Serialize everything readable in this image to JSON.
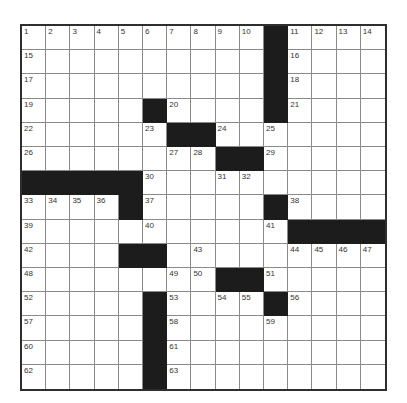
{
  "puzzle": {
    "size": 15,
    "colors": {
      "block": "#1c1c1c",
      "border": "#2e2e2e",
      "gridline": "#8a8a8a"
    },
    "rows": [
      "..........#....",
      "..........#....",
      "..........#....",
      ".....#....#....",
      "......##.......",
      "........##.....",
      "#####..........",
      "....#.....#....",
      "...........####",
      "....##.........",
      "........##.....",
      ".....#....#....",
      ".....#.........",
      ".....#.........",
      ".....#........."
    ],
    "numbers": [
      {
        "r": 0,
        "c": 0,
        "n": "1"
      },
      {
        "r": 0,
        "c": 1,
        "n": "2"
      },
      {
        "r": 0,
        "c": 2,
        "n": "3"
      },
      {
        "r": 0,
        "c": 3,
        "n": "4"
      },
      {
        "r": 0,
        "c": 4,
        "n": "5"
      },
      {
        "r": 0,
        "c": 5,
        "n": "6"
      },
      {
        "r": 0,
        "c": 6,
        "n": "7"
      },
      {
        "r": 0,
        "c": 7,
        "n": "8"
      },
      {
        "r": 0,
        "c": 8,
        "n": "9"
      },
      {
        "r": 0,
        "c": 9,
        "n": "10"
      },
      {
        "r": 0,
        "c": 11,
        "n": "11"
      },
      {
        "r": 0,
        "c": 12,
        "n": "12"
      },
      {
        "r": 0,
        "c": 13,
        "n": "13"
      },
      {
        "r": 0,
        "c": 14,
        "n": "14"
      },
      {
        "r": 1,
        "c": 0,
        "n": "15"
      },
      {
        "r": 1,
        "c": 11,
        "n": "16"
      },
      {
        "r": 2,
        "c": 0,
        "n": "17"
      },
      {
        "r": 2,
        "c": 11,
        "n": "18"
      },
      {
        "r": 3,
        "c": 0,
        "n": "19"
      },
      {
        "r": 3,
        "c": 6,
        "n": "20"
      },
      {
        "r": 3,
        "c": 11,
        "n": "21"
      },
      {
        "r": 4,
        "c": 0,
        "n": "22"
      },
      {
        "r": 4,
        "c": 5,
        "n": "23"
      },
      {
        "r": 4,
        "c": 8,
        "n": "24"
      },
      {
        "r": 4,
        "c": 10,
        "n": "25"
      },
      {
        "r": 5,
        "c": 0,
        "n": "26"
      },
      {
        "r": 5,
        "c": 6,
        "n": "27"
      },
      {
        "r": 5,
        "c": 7,
        "n": "28"
      },
      {
        "r": 5,
        "c": 10,
        "n": "29"
      },
      {
        "r": 6,
        "c": 5,
        "n": "30"
      },
      {
        "r": 6,
        "c": 8,
        "n": "31"
      },
      {
        "r": 6,
        "c": 9,
        "n": "32"
      },
      {
        "r": 7,
        "c": 0,
        "n": "33"
      },
      {
        "r": 7,
        "c": 1,
        "n": "34"
      },
      {
        "r": 7,
        "c": 2,
        "n": "35"
      },
      {
        "r": 7,
        "c": 3,
        "n": "36"
      },
      {
        "r": 7,
        "c": 5,
        "n": "37"
      },
      {
        "r": 7,
        "c": 11,
        "n": "38"
      },
      {
        "r": 8,
        "c": 0,
        "n": "39"
      },
      {
        "r": 8,
        "c": 5,
        "n": "40"
      },
      {
        "r": 8,
        "c": 10,
        "n": "41"
      },
      {
        "r": 9,
        "c": 0,
        "n": "42"
      },
      {
        "r": 9,
        "c": 7,
        "n": "43"
      },
      {
        "r": 9,
        "c": 11,
        "n": "44"
      },
      {
        "r": 9,
        "c": 12,
        "n": "45"
      },
      {
        "r": 9,
        "c": 13,
        "n": "46"
      },
      {
        "r": 9,
        "c": 14,
        "n": "47"
      },
      {
        "r": 10,
        "c": 0,
        "n": "48"
      },
      {
        "r": 10,
        "c": 6,
        "n": "49"
      },
      {
        "r": 10,
        "c": 7,
        "n": "50"
      },
      {
        "r": 10,
        "c": 10,
        "n": "51"
      },
      {
        "r": 11,
        "c": 0,
        "n": "52"
      },
      {
        "r": 11,
        "c": 6,
        "n": "53"
      },
      {
        "r": 11,
        "c": 8,
        "n": "54"
      },
      {
        "r": 11,
        "c": 9,
        "n": "55"
      },
      {
        "r": 11,
        "c": 11,
        "n": "56"
      },
      {
        "r": 12,
        "c": 0,
        "n": "57"
      },
      {
        "r": 12,
        "c": 6,
        "n": "58"
      },
      {
        "r": 12,
        "c": 10,
        "n": "59"
      },
      {
        "r": 13,
        "c": 0,
        "n": "60"
      },
      {
        "r": 13,
        "c": 6,
        "n": "61"
      },
      {
        "r": 14,
        "c": 0,
        "n": "62"
      },
      {
        "r": 14,
        "c": 6,
        "n": "63"
      }
    ]
  }
}
